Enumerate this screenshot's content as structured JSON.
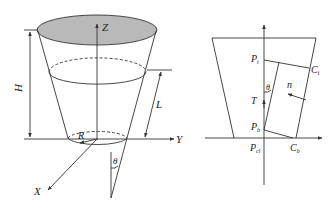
{
  "figure_left": {
    "title": "Truncated cone container in XYZ coordinates",
    "labels": {
      "z_axis": "Z",
      "y_axis": "Y",
      "x_axis": "X",
      "height": "H",
      "length": "L",
      "radius": "R",
      "angle": "θ"
    },
    "colors": {
      "top_face_fill": "#b9b9b9",
      "stroke": "#333333"
    }
  },
  "figure_right": {
    "title": "Cross-section with fluid element",
    "labels": {
      "p_top": "P",
      "p_top_sub": "t",
      "c_top": "C",
      "c_top_sub": "t",
      "angle": "θ",
      "normal": "n",
      "tension": "T",
      "p_bottom": "P",
      "p_bottom_sub": "b",
      "p_origin": "P",
      "p_origin_sub": "cl",
      "c_bottom": "C",
      "c_bottom_sub": "b"
    }
  }
}
